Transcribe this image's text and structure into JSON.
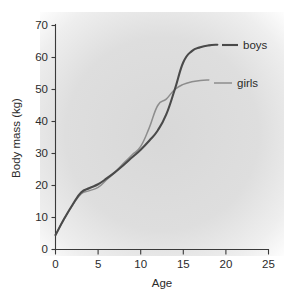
{
  "chart_data": {
    "type": "line",
    "title": "",
    "xlabel": "Age",
    "ylabel": "Body mass (kg)",
    "xlim": [
      0,
      25
    ],
    "ylim": [
      0,
      70
    ],
    "xticks": [
      "0",
      "5",
      "10",
      "15",
      "20",
      "25"
    ],
    "yticks": [
      "0",
      "10",
      "20",
      "30",
      "40",
      "50",
      "60",
      "70"
    ],
    "grid": false,
    "legend_position": "right-inline",
    "series": [
      {
        "name": "boys",
        "color": "#4a4a4a",
        "x": [
          0,
          1,
          2,
          3,
          4,
          5,
          6,
          7,
          8,
          9,
          10,
          11,
          12,
          13,
          14,
          15,
          16,
          17,
          18,
          19
        ],
        "values": [
          4.5,
          9.5,
          14,
          17.8,
          19.2,
          20.4,
          22.2,
          24.2,
          26.4,
          28.8,
          31.2,
          34,
          37.2,
          42.2,
          50,
          58.5,
          62,
          63.2,
          63.8,
          64
        ]
      },
      {
        "name": "girls",
        "color": "#8d8d8d",
        "x": [
          0,
          1,
          2,
          3,
          4,
          5,
          6,
          7,
          8,
          9,
          10,
          11,
          12,
          13,
          14,
          15,
          16,
          17,
          18
        ],
        "values": [
          4.5,
          9.5,
          13.8,
          17.4,
          18.4,
          19.4,
          21.8,
          24.2,
          27,
          29.6,
          32.2,
          38,
          45,
          47,
          50,
          51.6,
          52.4,
          52.8,
          53
        ]
      }
    ],
    "annotations": [
      {
        "text": "boys",
        "series": "boys"
      },
      {
        "text": "girls",
        "series": "girls"
      }
    ]
  }
}
